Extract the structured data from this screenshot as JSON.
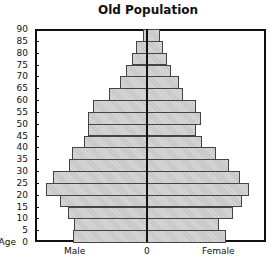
{
  "chart_data": {
    "type": "bar",
    "subtype": "population-pyramid",
    "title": "Old Population",
    "xlabel_left": "Male",
    "xlabel_center": "0",
    "xlabel_right": "Female",
    "ylabel": "Age",
    "yticks": [
      "0",
      "5",
      "10",
      "15",
      "20",
      "25",
      "30",
      "35",
      "40",
      "45",
      "50",
      "55",
      "60",
      "65",
      "70",
      "75",
      "80",
      "85",
      "90"
    ],
    "categories": [
      "0-5",
      "5-10",
      "10-15",
      "15-20",
      "20-25",
      "25-30",
      "30-35",
      "35-40",
      "40-45",
      "45-50",
      "50-55",
      "55-60",
      "60-65",
      "65-70",
      "70-75",
      "75-80",
      "80-85",
      "85-90"
    ],
    "units": "relative (no x-axis scale shown)",
    "series": [
      {
        "name": "Male",
        "values": [
          74,
          73,
          79,
          87,
          101,
          94,
          78,
          75,
          63,
          59,
          59,
          54,
          38,
          27,
          21,
          15,
          11,
          4
        ]
      },
      {
        "name": "Female",
        "values": [
          78,
          71,
          85,
          94,
          101,
          92,
          81,
          68,
          54,
          48,
          53,
          48,
          35,
          31,
          23,
          19,
          15,
          12
        ]
      }
    ],
    "grid": false,
    "legend": "none",
    "colors": {
      "bar_fill": "#c4c4c4",
      "bar_border": "#444444",
      "axis": "#111111"
    }
  }
}
